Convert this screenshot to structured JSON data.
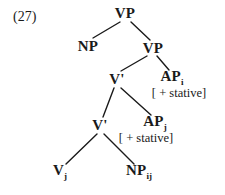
{
  "figure": {
    "example_number": "(27)",
    "ink_color": "#1a1a1a",
    "background_color": "#ffffff"
  },
  "diagram_data": {
    "type": "syntax-tree",
    "notation": "X-bar",
    "nodes": [
      {
        "id": "vp-root",
        "label": "VP",
        "subscript": "",
        "x": 125,
        "y": 13
      },
      {
        "id": "np-spec",
        "label": "NP",
        "subscript": "",
        "x": 88,
        "y": 46
      },
      {
        "id": "vp-inner",
        "label": "VP",
        "subscript": "",
        "x": 153,
        "y": 48
      },
      {
        "id": "vbar-1",
        "label": "V'",
        "subscript": "",
        "x": 117,
        "y": 79
      },
      {
        "id": "ap-i",
        "label": "AP",
        "subscript": "i",
        "x": 172,
        "y": 78
      },
      {
        "id": "vbar-2",
        "label": "V'",
        "subscript": "",
        "x": 100,
        "y": 125
      },
      {
        "id": "ap-j",
        "label": "AP",
        "subscript": "j",
        "x": 155,
        "y": 123
      },
      {
        "id": "v-j",
        "label": "V",
        "subscript": "j",
        "x": 60,
        "y": 172
      },
      {
        "id": "np-ij",
        "label": "NP",
        "subscript": "ij",
        "x": 139,
        "y": 172
      }
    ],
    "features": [
      {
        "id": "feature-ap-i",
        "text": "[ + stative]",
        "x": 179,
        "y": 93,
        "attached_to": "ap-i"
      },
      {
        "id": "feature-ap-j",
        "text": "[ + stative]",
        "x": 146,
        "y": 138,
        "attached_to": "ap-j"
      }
    ],
    "edges": [
      {
        "from": "vp-root",
        "to": "np-spec",
        "x1": 120,
        "y1": 22,
        "x2": 93,
        "y2": 38
      },
      {
        "from": "vp-root",
        "to": "vp-inner",
        "x1": 131,
        "y1": 22,
        "x2": 150,
        "y2": 40
      },
      {
        "from": "vp-inner",
        "to": "vbar-1",
        "x1": 147,
        "y1": 56,
        "x2": 121,
        "y2": 71
      },
      {
        "from": "vp-inner",
        "to": "ap-i",
        "x1": 157,
        "y1": 56,
        "x2": 169,
        "y2": 70
      },
      {
        "from": "vbar-1",
        "to": "vbar-2",
        "x1": 114,
        "y1": 88,
        "x2": 103,
        "y2": 117
      },
      {
        "from": "vbar-1",
        "to": "ap-j",
        "x1": 121,
        "y1": 88,
        "x2": 151,
        "y2": 115
      },
      {
        "from": "vbar-2",
        "to": "v-j",
        "x1": 97,
        "y1": 134,
        "x2": 66,
        "y2": 164
      },
      {
        "from": "vbar-2",
        "to": "np-ij",
        "x1": 104,
        "y1": 134,
        "x2": 134,
        "y2": 164
      }
    ],
    "example_label": {
      "text": "(27)",
      "x": 13,
      "y": 10
    },
    "coindexation": {
      "i": [
        "ap-i",
        "np-ij"
      ],
      "j": [
        "ap-j",
        "v-j",
        "np-ij"
      ]
    }
  }
}
